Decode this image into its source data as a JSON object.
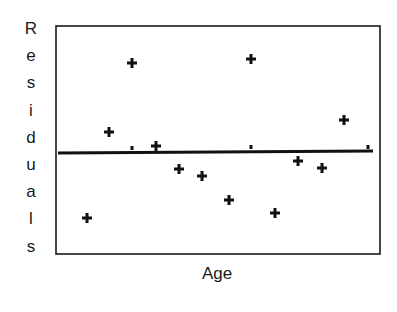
{
  "chart_data": {
    "type": "scatter",
    "title": "",
    "xlabel": "Age",
    "ylabel": "Residuals",
    "grid": false,
    "legend": null,
    "x_ticks": [],
    "y_ticks": [],
    "reference_line": {
      "y": 0,
      "label": "zero residual line"
    },
    "marker": "+",
    "plot_box_px": {
      "left": 56,
      "top": 26,
      "right": 380,
      "bottom": 254
    },
    "zero_line_px": {
      "x1": 58,
      "y1": 153,
      "x2": 373,
      "y2": 151
    },
    "points_px": [
      {
        "x": 87,
        "y": 218
      },
      {
        "x": 109,
        "y": 132
      },
      {
        "x": 132,
        "y": 63
      },
      {
        "x": 156,
        "y": 146
      },
      {
        "x": 179,
        "y": 169
      },
      {
        "x": 202,
        "y": 176
      },
      {
        "x": 229,
        "y": 200
      },
      {
        "x": 251,
        "y": 59
      },
      {
        "x": 275,
        "y": 213
      },
      {
        "x": 298,
        "y": 161
      },
      {
        "x": 322,
        "y": 168
      },
      {
        "x": 344,
        "y": 120
      }
    ],
    "on_line_ticks_px": [
      {
        "x": 132,
        "y": 149
      },
      {
        "x": 251,
        "y": 148
      },
      {
        "x": 368,
        "y": 148
      }
    ],
    "approx_relative_residuals": [
      -6.5,
      2.1,
      9.0,
      0.6,
      -1.6,
      -2.3,
      -4.7,
      9.3,
      -6.0,
      -1.0,
      -1.7,
      3.1
    ]
  },
  "labels": {
    "y_letters": [
      "R",
      "e",
      "s",
      "i",
      "d",
      "u",
      "a",
      "l",
      "s"
    ],
    "x_label": "Age"
  },
  "colors": {
    "ink": "#111111",
    "background": "#ffffff"
  }
}
